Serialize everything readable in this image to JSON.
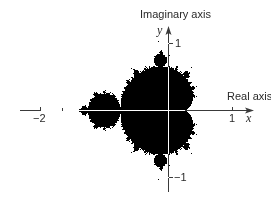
{
  "figure": {
    "x_axis_label": "Real axis",
    "y_axis_label": "Imaginary axis",
    "x_var": "x",
    "y_var": "y",
    "x_ticks": [
      {
        "value": -2,
        "label": "−2"
      },
      {
        "value": 1,
        "label": "1"
      }
    ],
    "y_ticks": [
      {
        "value": 1,
        "label": "1"
      },
      {
        "value": -1,
        "label": "−1"
      }
    ],
    "colors": {
      "set": "#000000",
      "background": "#ffffff",
      "axis_on_background": "#3a3a3a",
      "axis_on_set": "#ffffff",
      "text": "#2a2a2a"
    },
    "mapping": {
      "origin_px": [
        168,
        110
      ],
      "x_scale_px_per_unit": 64,
      "y_scale_px_per_unit": 67,
      "max_iterations": 60
    }
  }
}
